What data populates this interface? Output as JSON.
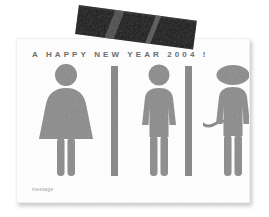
{
  "scene": {
    "background_color": "#ffffff",
    "description": "new-year-greeting-card-photo"
  },
  "card": {
    "background_color": "#fefefe",
    "headline": "A  HAPPY  NEW  YEAR  2004 !",
    "message_label": "message",
    "headline_color": "#6d6d6d",
    "message_color": "#9b9b9b"
  },
  "tape": {
    "color": "#141414",
    "name": "black-adhesive-tape"
  },
  "pictograms": {
    "fill_color": "#8a8a8a",
    "items": [
      {
        "name": "woman-pictogram",
        "label": "woman"
      },
      {
        "name": "man-pictogram",
        "label": "man"
      },
      {
        "name": "monkey-pictogram",
        "label": "monkey"
      }
    ],
    "dividers": [
      {
        "name": "divider-bar-1"
      },
      {
        "name": "divider-bar-2"
      }
    ]
  }
}
